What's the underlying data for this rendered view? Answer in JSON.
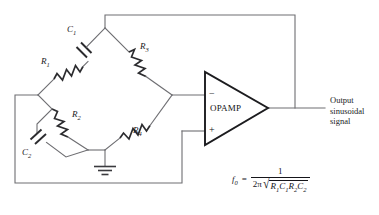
{
  "diagram": {
    "components": [
      {
        "id": "R1",
        "label": "R",
        "sub": "1",
        "type": "resistor",
        "arm": "upper-left"
      },
      {
        "id": "C1",
        "label": "C",
        "sub": "1",
        "type": "capacitor",
        "arm": "upper-left"
      },
      {
        "id": "R3",
        "label": "R",
        "sub": "3",
        "type": "resistor",
        "arm": "upper-right"
      },
      {
        "id": "R2",
        "label": "R",
        "sub": "2",
        "type": "resistor",
        "arm": "lower-left"
      },
      {
        "id": "C2",
        "label": "C",
        "sub": "2",
        "type": "capacitor",
        "arm": "lower-left-parallel"
      },
      {
        "id": "R4",
        "label": "R",
        "sub": "4",
        "type": "resistor",
        "arm": "lower-right"
      }
    ],
    "opamp": {
      "name": "OPAMP",
      "inverting_pin": "−",
      "noninverting_pin": "+"
    },
    "ground": {
      "name": "ground-symbol"
    },
    "output": {
      "line1": "Output",
      "line2": "sinusoidal",
      "line3": "signal"
    },
    "formula": {
      "lhs_var": "f",
      "lhs_sub": "0",
      "equals": "=",
      "numerator": "1",
      "den_coeff": "2π",
      "radicand": [
        {
          "v": "R",
          "s": "1"
        },
        {
          "v": "C",
          "s": "1"
        },
        {
          "v": "R",
          "s": "2"
        },
        {
          "v": "C",
          "s": "2"
        }
      ],
      "plain": "f0 = 1 / (2π √(R1 C1 R2 C2))"
    },
    "colors": {
      "wire": "#6e6e72",
      "component": "#2b2b2e",
      "text": "#1a1a1c",
      "background": "#ffffff"
    }
  }
}
